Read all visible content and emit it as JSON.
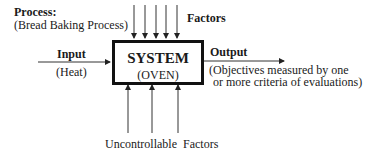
{
  "process": {
    "label": "Process:",
    "description": "(Bread Baking Process)"
  },
  "factors": {
    "controllable_label": "Factors",
    "uncontrollable_label": "Uncontrollable  Factors",
    "top_arrow_count": 5,
    "bottom_arrow_count": 3
  },
  "input": {
    "label": "Input",
    "sublabel": "(Heat)"
  },
  "system": {
    "title": "SYSTEM",
    "subtitle": "(OVEN)"
  },
  "output": {
    "label": "Output",
    "line1": "(Objectives measured by one",
    "line2": "or more criteria of evaluations)"
  }
}
